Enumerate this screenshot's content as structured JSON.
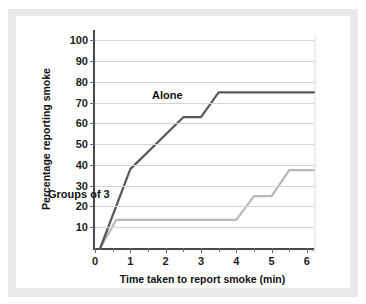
{
  "chart_data": {
    "type": "line",
    "title": "",
    "xlabel": "Time taken to report smoke (min)",
    "ylabel": "Percentage reporting smoke",
    "xlim": [
      0,
      6.2
    ],
    "ylim": [
      0,
      105
    ],
    "grid": true,
    "legend_position": "inline-annotations",
    "xticks": [
      0,
      1,
      2,
      3,
      4,
      5,
      6
    ],
    "xtick_labels": [
      "0",
      "1",
      "2",
      "3",
      "4",
      "5",
      "6"
    ],
    "xminor_ticks": [
      0.5,
      1.5,
      2.5,
      3.5,
      4.5,
      5.5
    ],
    "yticks": [
      10,
      20,
      30,
      40,
      50,
      60,
      70,
      80,
      90,
      100
    ],
    "ytick_labels": [
      "10",
      "20",
      "30",
      "40",
      "50",
      "60",
      "70",
      "80",
      "90",
      "100"
    ],
    "series": [
      {
        "name": "Alone",
        "color": "#585858",
        "annotation": "Alone",
        "points": [
          [
            0.15,
            0
          ],
          [
            1.0,
            38
          ],
          [
            2.5,
            63
          ],
          [
            3.0,
            63
          ],
          [
            3.5,
            75
          ],
          [
            6.2,
            75
          ]
        ]
      },
      {
        "name": "Groups of 3",
        "color": "#b8b8b8",
        "annotation": "Groups of 3",
        "points": [
          [
            0.15,
            0
          ],
          [
            0.6,
            13.5
          ],
          [
            4.0,
            13.5
          ],
          [
            4.5,
            25
          ],
          [
            5.0,
            25
          ],
          [
            5.5,
            37.5
          ],
          [
            6.2,
            37.5
          ]
        ]
      }
    ],
    "colors": {
      "alone_line": "#585858",
      "groups_line": "#b8b8b8",
      "axis": "#4a4a4a",
      "gridline": "#d4d4d4",
      "panel_background": "#e9e9e9",
      "plot_background": "#ffffff",
      "text": "#111111"
    }
  }
}
